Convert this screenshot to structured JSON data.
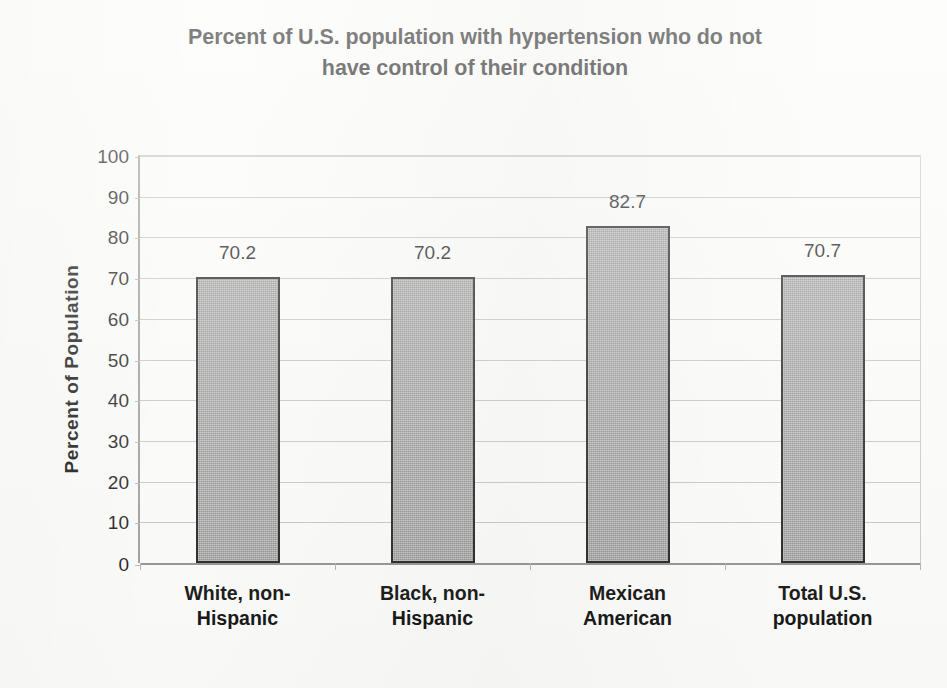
{
  "chart_data": {
    "type": "bar",
    "title": "Percent of U.S. population with hypertension who do not have control of their condition",
    "title_lines": [
      "Percent of U.S. population with hypertension who do not",
      "have control of their condition"
    ],
    "xlabel": "",
    "ylabel": "Percent of Population",
    "categories": [
      "White, non-Hispanic",
      "Black, non-Hispanic",
      "Mexican American",
      "Total U.S. population"
    ],
    "category_lines": [
      [
        "White, non-",
        "Hispanic"
      ],
      [
        "Black, non-",
        "Hispanic"
      ],
      [
        "Mexican",
        "American"
      ],
      [
        "Total U.S.",
        "population"
      ]
    ],
    "values": [
      70.2,
      70.2,
      82.7,
      70.7
    ],
    "value_labels": [
      "70.2",
      "70.2",
      "82.7",
      "70.7"
    ],
    "ylim": [
      0,
      100
    ],
    "ytick_step": 10,
    "ytick_labels": [
      "100",
      "90",
      "80",
      "70",
      "60",
      "50",
      "40",
      "30",
      "20",
      "10",
      "0"
    ],
    "ytick_values": [
      100,
      90,
      80,
      70,
      60,
      50,
      40,
      30,
      20,
      10,
      0
    ],
    "grid": true,
    "legend": false,
    "bar_color": "#8a8a8a",
    "bar_border_color": "#1b1b1b",
    "gridline_color": "#c4c4c4",
    "axis_color": "#8e8e8e",
    "text_color": "#101010",
    "background_color": "#fbfbf9"
  }
}
